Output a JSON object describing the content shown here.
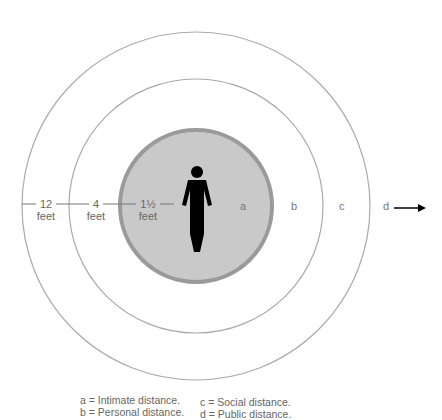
{
  "diagram": {
    "distance_labels": [
      {
        "value": "12",
        "unit": "feet"
      },
      {
        "value": "4",
        "unit": "feet"
      },
      {
        "value": "1½",
        "unit": "feet"
      }
    ],
    "zones": [
      "a",
      "b",
      "c",
      "d"
    ],
    "colors": {
      "inner_fill": "#c8c8c8",
      "inner_border": "#9a9a9a",
      "ring_stroke": "#aaaaaa",
      "figure": "#000000"
    },
    "legend": [
      {
        "key": "a",
        "text": "a = Intimate distance."
      },
      {
        "key": "b",
        "text": "b = Personal distance."
      },
      {
        "key": "c",
        "text": "c = Social distance."
      },
      {
        "key": "d",
        "text": "d = Public distance."
      }
    ]
  }
}
